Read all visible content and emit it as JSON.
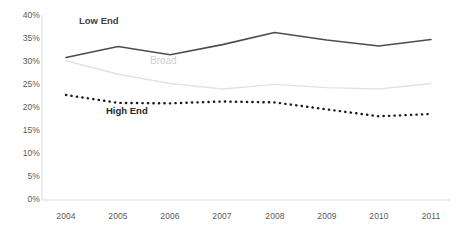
{
  "chart_data": {
    "type": "line",
    "title": "",
    "subtitle": "",
    "xlabel": "",
    "ylabel": "",
    "categories": [
      "2004",
      "2005",
      "2006",
      "2007",
      "2008",
      "2009",
      "2010",
      "2011"
    ],
    "x": [
      2004,
      2005,
      2006,
      2007,
      2008,
      2009,
      2010,
      2011
    ],
    "ylim": [
      0,
      40
    ],
    "yticks": [
      0,
      5,
      10,
      15,
      20,
      25,
      30,
      35,
      40
    ],
    "ytick_labels": [
      "0%",
      "5%",
      "10%",
      "15%",
      "20%",
      "25%",
      "30%",
      "35%",
      "40%"
    ],
    "grid": false,
    "legend_position": "inline-annotations",
    "series": [
      {
        "name": "Low End",
        "values": [
          30.8,
          33.2,
          31.4,
          33.6,
          36.2,
          34.6,
          33.3,
          34.7
        ],
        "color": "#4d4d4d",
        "style": "solid",
        "width": 1.6
      },
      {
        "name": "Broad",
        "values": [
          30.1,
          27.2,
          25.2,
          24.0,
          25.0,
          24.3,
          24.0,
          25.2
        ],
        "color": "#e2e2e2",
        "style": "solid",
        "width": 1.4
      },
      {
        "name": "High End",
        "values": [
          22.7,
          21.0,
          20.9,
          21.3,
          21.1,
          19.6,
          18.1,
          18.6
        ],
        "color": "#1a1a1a",
        "style": "dotted",
        "width": 2.4
      }
    ],
    "annotations": [
      {
        "text": "Low End",
        "series": "Low End",
        "x_px": 79,
        "y_px": 22
      },
      {
        "text": "Broad",
        "series": "Broad",
        "x_px": 150,
        "y_px": 62
      },
      {
        "text": "High End",
        "series": "High End",
        "x_px": 106,
        "y_px": 112
      }
    ],
    "axis_color": "#d9d9d9",
    "tick_label_color": "#595959"
  }
}
